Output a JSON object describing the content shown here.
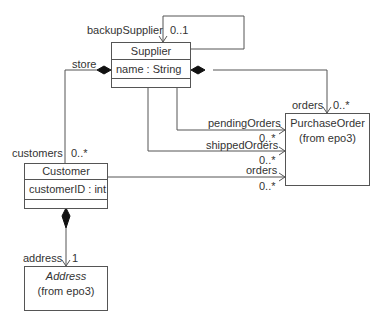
{
  "classes": {
    "supplier": {
      "name": "Supplier",
      "attribute": "name : String"
    },
    "customer": {
      "name": "Customer",
      "attribute": "customerID : int"
    },
    "purchase_order": {
      "name": "PurchaseOrder",
      "package": "(from epo3)"
    },
    "address": {
      "name": "Address",
      "package": "(from epo3)"
    }
  },
  "associations": {
    "backup_supplier": {
      "role": "backupSupplier",
      "multiplicity": "0..1"
    },
    "store": {
      "role": "store"
    },
    "customers": {
      "role": "customers",
      "multiplicity": "0..*"
    },
    "supplier_orders": {
      "role": "orders",
      "multiplicity": "0..*"
    },
    "pending_orders": {
      "role": "pendingOrders",
      "multiplicity": "0..*"
    },
    "shipped_orders": {
      "role": "shippedOrders",
      "multiplicity": "0..*"
    },
    "customer_orders": {
      "role": "orders",
      "multiplicity": "0..*"
    },
    "address": {
      "role": "address",
      "multiplicity": "1"
    }
  },
  "colors": {
    "line": "#555555",
    "text": "#333333",
    "background": "#ffffff"
  }
}
